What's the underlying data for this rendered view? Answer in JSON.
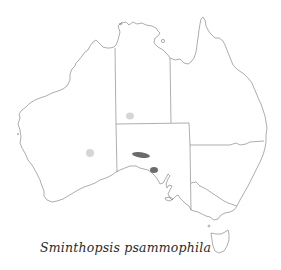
{
  "map": {
    "region": "Australia",
    "caption": "Sminthopsis psammophila",
    "colors": {
      "coastline": "#8a8a8a",
      "state_border": "#777777",
      "range_current": "#6b6b6b",
      "range_historic": "#d6d6d6",
      "background": "#ffffff"
    },
    "ranges": [
      {
        "type": "historic",
        "location": "southern Northern Territory",
        "cx": 130,
        "cy": 116,
        "rx": 4,
        "ry": 3.5
      },
      {
        "type": "historic",
        "location": "central Western Australia",
        "cx": 90,
        "cy": 153,
        "rx": 4,
        "ry": 4
      },
      {
        "type": "current",
        "location": "northwest South Australia",
        "cx": 141,
        "cy": 155,
        "rx": 9,
        "ry": 2.8
      },
      {
        "type": "current",
        "location": "Eyre Peninsula, South Australia",
        "cx": 154,
        "cy": 170,
        "rx": 4,
        "ry": 3
      }
    ]
  }
}
